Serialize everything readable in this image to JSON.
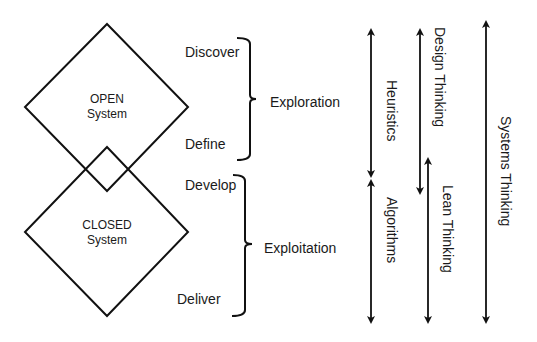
{
  "diagram": {
    "open_system": {
      "line1": "OPEN",
      "line2": "System"
    },
    "closed_system": {
      "line1": "CLOSED",
      "line2": "System"
    },
    "phases": {
      "discover": "Discover",
      "define": "Define",
      "develop": "Develop",
      "deliver": "Deliver"
    },
    "groups": {
      "exploration": "Exploration",
      "exploitation": "Exploitation"
    },
    "arrows": {
      "heuristics": "Heuristics",
      "algorithms": "Algorithms",
      "design_thinking": "Design Thinking",
      "lean_thinking": "Lean Thinking",
      "systems_thinking": "Systems Thinking"
    },
    "stroke_color": "#111111"
  }
}
